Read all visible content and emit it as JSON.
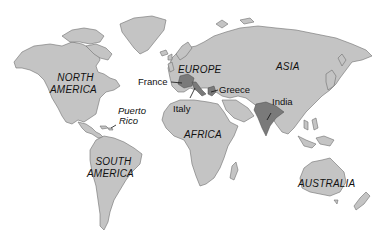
{
  "map": {
    "type": "world-political-outline",
    "colors": {
      "ocean": "#ffffff",
      "land": "#c4c4c4",
      "highlighted_country": "#7a7a7a",
      "coastline": "#6e6e6e",
      "label_text": "#111111"
    },
    "continents": [
      {
        "id": "north-america",
        "label_line1": "NORTH",
        "label_line2": "AMERICA"
      },
      {
        "id": "south-america",
        "label_line1": "SOUTH",
        "label_line2": "AMERICA"
      },
      {
        "id": "europe",
        "label": "EUROPE"
      },
      {
        "id": "africa",
        "label": "AFRICA"
      },
      {
        "id": "asia",
        "label": "ASIA"
      },
      {
        "id": "australia",
        "label": "AUSTRALIA"
      }
    ],
    "places": [
      {
        "id": "france",
        "label": "France",
        "highlighted": true
      },
      {
        "id": "italy",
        "label": "Italy",
        "highlighted": true
      },
      {
        "id": "greece",
        "label": "Greece",
        "highlighted": true
      },
      {
        "id": "india",
        "label": "India",
        "highlighted": true
      },
      {
        "id": "puerto-rico",
        "label_line1": "Puerto",
        "label_line2": "Rico",
        "highlighted": false
      }
    ]
  }
}
